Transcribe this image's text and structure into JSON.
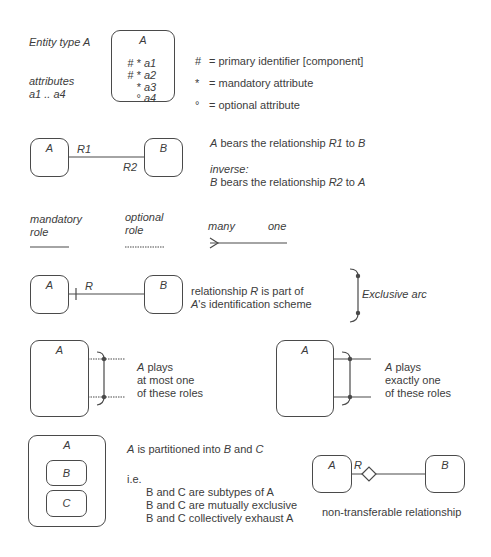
{
  "legend_entity": {
    "title": "Entity type A",
    "attributes_label_1": "attributes",
    "attributes_label_2": "a1 .. a4",
    "box_name": "A",
    "attributes": [
      {
        "marks": "# *",
        "name": "a1"
      },
      {
        "marks": "# *",
        "name": "a2"
      },
      {
        "marks": "*",
        "name": "a3"
      },
      {
        "marks": "°",
        "name": "a4"
      }
    ],
    "key": [
      {
        "symbol": "#",
        "text": "= primary identifier [component]"
      },
      {
        "symbol": "*",
        "text": "= mandatory attribute"
      },
      {
        "symbol": "°",
        "text": "= optional attribute"
      }
    ]
  },
  "relationship": {
    "entity_a": "A",
    "entity_b": "B",
    "r1": "R1",
    "r2": "R2",
    "desc_entity_a": "A",
    "desc_mid": " bears the relationship ",
    "desc_r1": "R1",
    "desc_to": " to ",
    "desc_entity_b": "B",
    "inverse_label": "inverse:",
    "inv_entity_b": "B",
    "inv_r2": "R2",
    "inv_entity_a": "A"
  },
  "roles": {
    "mandatory_1": "mandatory",
    "mandatory_2": "role",
    "optional_1": "optional",
    "optional_2": "role",
    "many": "many",
    "one": "one"
  },
  "identification": {
    "entity_a": "A",
    "entity_b": "B",
    "rel": "R",
    "text_1_pre": "relationship ",
    "text_1_r": "R",
    "text_1_post": " is part of",
    "text_2_a": "A",
    "text_2_post": "'s identification scheme",
    "arc_label": "Exclusive arc"
  },
  "arcs": {
    "left_entity": "A",
    "left_text_a": "A",
    "left_text_1": " plays",
    "left_text_2": "at most one",
    "left_text_3": "of these roles",
    "right_entity": "A",
    "right_text_a": "A",
    "right_text_1": " plays",
    "right_text_2": "exactly one",
    "right_text_3": "of these roles"
  },
  "subtypes": {
    "super": "A",
    "sub_1": "B",
    "sub_2": "C",
    "heading": "is partitioned into B and C",
    "ie": "i.e.",
    "lines": [
      "B and C are subtypes of A",
      "B and C are mutually exclusive",
      "B and C collectively exhaust A"
    ]
  },
  "nontransferable": {
    "entity_a": "A",
    "entity_b": "B",
    "rel": "R",
    "caption": "non-transferable relationship"
  }
}
